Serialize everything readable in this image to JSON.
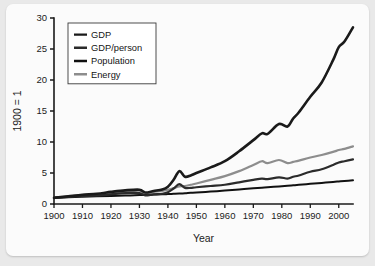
{
  "chart_data": {
    "type": "line",
    "title": "",
    "xlabel": "Year",
    "ylabel": "1900 = 1",
    "xlim": [
      1900,
      2005
    ],
    "ylim": [
      0,
      30
    ],
    "grid": false,
    "legend_position": "top-left",
    "xticks": [
      "1900",
      "1910",
      "1920",
      "1930",
      "1940",
      "1950",
      "1960",
      "1970",
      "1980",
      "1990",
      "2000"
    ],
    "xtick_values": [
      1900,
      1910,
      1920,
      1930,
      1940,
      1950,
      1960,
      1970,
      1980,
      1990,
      2000
    ],
    "yticks": [
      "0",
      "5",
      "10",
      "15",
      "20",
      "25",
      "30"
    ],
    "ytick_values": [
      0,
      5,
      10,
      15,
      20,
      25,
      30
    ],
    "x": [
      1900,
      1905,
      1910,
      1915,
      1920,
      1925,
      1930,
      1932,
      1935,
      1938,
      1940,
      1942,
      1944,
      1946,
      1948,
      1950,
      1955,
      1960,
      1965,
      1970,
      1973,
      1975,
      1979,
      1982,
      1984,
      1986,
      1990,
      1994,
      1998,
      2000,
      2002,
      2005
    ],
    "series": [
      {
        "name": "GDP",
        "color": "#1a1a1a",
        "width": 2.6,
        "values": [
          1.0,
          1.25,
          1.5,
          1.65,
          1.95,
          2.2,
          2.3,
          1.85,
          2.1,
          2.35,
          2.8,
          3.9,
          5.3,
          4.4,
          4.6,
          5.0,
          5.9,
          6.9,
          8.5,
          10.3,
          11.4,
          11.3,
          12.9,
          12.5,
          13.8,
          14.8,
          17.3,
          19.6,
          23.2,
          25.3,
          26.2,
          28.5
        ]
      },
      {
        "name": "GDP/person",
        "color": "#2b2b2b",
        "width": 2.2,
        "values": [
          1.0,
          1.15,
          1.3,
          1.35,
          1.55,
          1.75,
          1.75,
          1.4,
          1.55,
          1.65,
          1.9,
          2.5,
          3.2,
          2.6,
          2.6,
          2.7,
          2.9,
          3.1,
          3.5,
          3.9,
          4.1,
          4.0,
          4.3,
          4.1,
          4.4,
          4.6,
          5.2,
          5.6,
          6.3,
          6.7,
          6.9,
          7.2
        ]
      },
      {
        "name": "Population",
        "color": "#111111",
        "width": 2.0,
        "values": [
          1.0,
          1.08,
          1.16,
          1.23,
          1.29,
          1.36,
          1.44,
          1.47,
          1.52,
          1.57,
          1.6,
          1.64,
          1.68,
          1.73,
          1.8,
          1.85,
          2.0,
          2.16,
          2.35,
          2.53,
          2.64,
          2.7,
          2.84,
          2.95,
          3.02,
          3.1,
          3.25,
          3.4,
          3.56,
          3.64,
          3.71,
          3.82
        ]
      },
      {
        "name": "Energy",
        "color": "#8d8d8d",
        "width": 2.2,
        "values": [
          1.0,
          1.2,
          1.45,
          1.55,
          1.8,
          2.0,
          2.15,
          1.75,
          1.95,
          2.1,
          2.3,
          2.55,
          2.85,
          2.9,
          3.1,
          3.3,
          3.9,
          4.5,
          5.3,
          6.3,
          6.9,
          6.6,
          7.1,
          6.6,
          6.8,
          7.0,
          7.5,
          7.9,
          8.4,
          8.7,
          8.9,
          9.3
        ]
      }
    ]
  },
  "legend": {
    "entries": [
      {
        "label": "GDP"
      },
      {
        "label": "GDP/person"
      },
      {
        "label": "Population"
      },
      {
        "label": "Energy"
      }
    ]
  }
}
